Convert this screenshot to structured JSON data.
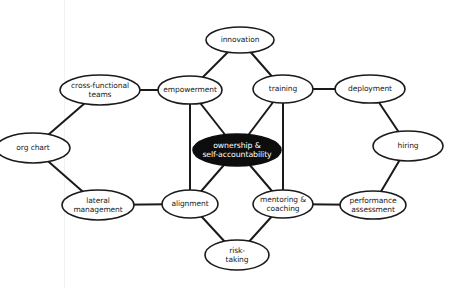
{
  "diagram": {
    "type": "concept-map",
    "colors": {
      "background": "#ffffff",
      "stroke": "#1a1a1a",
      "center_fill": "#0d0d0d",
      "center_text": "#ffffff",
      "node_fill": "#ffffff"
    },
    "nodes": [
      {
        "id": "innovation",
        "label": "innovation",
        "cx": 240,
        "cy": 40,
        "rx": 34,
        "ry": 13
      },
      {
        "id": "cross_functional",
        "label": "cross-functional\nteams",
        "cx": 100,
        "cy": 90,
        "rx": 40,
        "ry": 15
      },
      {
        "id": "empowerment",
        "label": "empowerment",
        "cx": 190,
        "cy": 90,
        "rx": 32,
        "ry": 14
      },
      {
        "id": "training",
        "label": "training",
        "cx": 283,
        "cy": 89,
        "rx": 30,
        "ry": 14
      },
      {
        "id": "deployment",
        "label": "deployment",
        "cx": 370,
        "cy": 89,
        "rx": 35,
        "ry": 14
      },
      {
        "id": "org_chart",
        "label": "org chart",
        "cx": 33,
        "cy": 148,
        "rx": 37,
        "ry": 15
      },
      {
        "id": "ownership",
        "label": "ownership &\nself-accountability",
        "cx": 237,
        "cy": 150,
        "rx": 44,
        "ry": 16,
        "dark": true
      },
      {
        "id": "hiring",
        "label": "hiring",
        "cx": 408,
        "cy": 146,
        "rx": 35,
        "ry": 15
      },
      {
        "id": "lateral_management",
        "label": "lateral\nmanagement",
        "cx": 98,
        "cy": 205,
        "rx": 36,
        "ry": 15
      },
      {
        "id": "alignment",
        "label": "alignment",
        "cx": 190,
        "cy": 204,
        "rx": 28,
        "ry": 14
      },
      {
        "id": "mentoring",
        "label": "mentoring &\ncoaching",
        "cx": 283,
        "cy": 204,
        "rx": 30,
        "ry": 14
      },
      {
        "id": "performance",
        "label": "performance\nassessment",
        "cx": 373,
        "cy": 205,
        "rx": 33,
        "ry": 14
      },
      {
        "id": "risk_taking",
        "label": "risk-\ntaking",
        "cx": 237,
        "cy": 255,
        "rx": 32,
        "ry": 15
      }
    ],
    "edges": [
      {
        "from": "innovation",
        "to": "empowerment"
      },
      {
        "from": "innovation",
        "to": "training"
      },
      {
        "from": "cross_functional",
        "to": "empowerment"
      },
      {
        "from": "training",
        "to": "deployment"
      },
      {
        "from": "cross_functional",
        "to": "org_chart"
      },
      {
        "from": "org_chart",
        "to": "lateral_management"
      },
      {
        "from": "deployment",
        "to": "hiring"
      },
      {
        "from": "hiring",
        "to": "performance"
      },
      {
        "from": "empowerment",
        "to": "ownership"
      },
      {
        "from": "training",
        "to": "ownership"
      },
      {
        "from": "alignment",
        "to": "ownership"
      },
      {
        "from": "mentoring",
        "to": "ownership"
      },
      {
        "from": "empowerment",
        "to": "alignment"
      },
      {
        "from": "training",
        "to": "mentoring"
      },
      {
        "from": "lateral_management",
        "to": "alignment"
      },
      {
        "from": "mentoring",
        "to": "performance"
      },
      {
        "from": "alignment",
        "to": "risk_taking"
      },
      {
        "from": "mentoring",
        "to": "risk_taking"
      }
    ]
  }
}
